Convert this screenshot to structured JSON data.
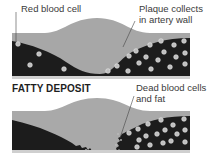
{
  "top_panel": {
    "label_red_blood_cell": "Red blood cell",
    "label_plaque_line1": "Plaque collects",
    "label_plaque_line2": "in artery wall"
  },
  "bottom_panel": {
    "title": "FATTY DEPOSIT",
    "label_dead_line1": "Dead blood cells",
    "label_dead_line2": "and fat"
  },
  "colors": {
    "lumen": "#1c1c1c",
    "plaque": "#a8a8a8",
    "wall": "#c9c9c9",
    "cell": "#bdbdbd",
    "text": "#3a3a3a"
  }
}
